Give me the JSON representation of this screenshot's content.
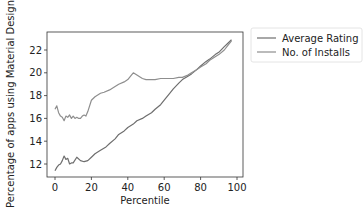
{
  "chart_data": {
    "type": "line",
    "title": "",
    "xlabel": "Percentile",
    "ylabel": "Percentage of apps using Material Design",
    "xlim": [
      -4,
      102
    ],
    "ylim": [
      11,
      23.3
    ],
    "xticks": [
      0,
      20,
      40,
      60,
      80,
      100
    ],
    "yticks": [
      12,
      14,
      16,
      18,
      20,
      22
    ],
    "grid": false,
    "legend_position": "outside upper right",
    "series": [
      {
        "name": "Average Rating",
        "color": "#6e6e6e",
        "x": [
          0,
          1,
          2,
          3,
          4,
          5,
          6,
          7,
          8,
          9,
          10,
          12,
          14,
          16,
          18,
          20,
          22,
          25,
          28,
          30,
          33,
          35,
          38,
          40,
          43,
          45,
          48,
          50,
          53,
          55,
          58,
          60,
          63,
          65,
          68,
          70,
          73,
          75,
          78,
          80,
          83,
          85,
          88,
          90,
          93,
          95,
          97
        ],
        "values": [
          11.4,
          11.7,
          11.9,
          12.0,
          12.3,
          12.7,
          12.4,
          12.5,
          12.0,
          12.1,
          12.1,
          12.6,
          12.3,
          12.2,
          12.3,
          12.6,
          12.9,
          13.2,
          13.5,
          13.8,
          14.2,
          14.6,
          14.9,
          15.2,
          15.5,
          15.8,
          16.0,
          16.2,
          16.5,
          16.8,
          17.2,
          17.6,
          18.2,
          18.6,
          19.1,
          19.4,
          19.7,
          19.9,
          20.3,
          20.6,
          21.0,
          21.2,
          21.6,
          21.8,
          22.3,
          22.6,
          22.9
        ]
      },
      {
        "name": "No. of Installs",
        "color": "#8e8e8e",
        "x": [
          0,
          1,
          2,
          3,
          4,
          5,
          6,
          7,
          8,
          9,
          10,
          11,
          12,
          13,
          14,
          15,
          16,
          17,
          18,
          20,
          22,
          25,
          27,
          30,
          33,
          35,
          38,
          40,
          42,
          43,
          45,
          48,
          50,
          53,
          55,
          58,
          60,
          63,
          65,
          68,
          70,
          73,
          75,
          78,
          80,
          83,
          85,
          88,
          90,
          93,
          95,
          97
        ],
        "values": [
          16.8,
          17.1,
          16.5,
          16.2,
          16.1,
          15.8,
          16.2,
          16.1,
          16.3,
          16.0,
          16.2,
          16.0,
          16.1,
          16.0,
          16.0,
          16.2,
          16.3,
          16.2,
          16.6,
          17.6,
          17.9,
          18.2,
          18.3,
          18.5,
          18.8,
          19.0,
          19.2,
          19.4,
          19.8,
          20.0,
          19.8,
          19.5,
          19.4,
          19.4,
          19.4,
          19.5,
          19.5,
          19.5,
          19.5,
          19.6,
          19.6,
          19.8,
          20.0,
          20.3,
          20.5,
          20.8,
          21.1,
          21.4,
          21.6,
          22.0,
          22.4,
          22.8
        ]
      }
    ]
  }
}
